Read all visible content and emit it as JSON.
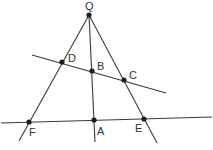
{
  "diagram": {
    "type": "geometry",
    "colors": {
      "line": "#3a3a3a",
      "point": "#1e1e1e",
      "label": "#333333"
    },
    "points": [
      {
        "name": "Q",
        "x": 89,
        "y": 15,
        "lx": 85,
        "ly": 10
      },
      {
        "name": "D",
        "x": 62,
        "y": 62,
        "lx": 68,
        "ly": 62
      },
      {
        "name": "B",
        "x": 92,
        "y": 71,
        "lx": 97,
        "ly": 70
      },
      {
        "name": "C",
        "x": 124,
        "y": 80,
        "lx": 129,
        "ly": 79
      },
      {
        "name": "F",
        "x": 29,
        "y": 122,
        "lx": 29,
        "ly": 136
      },
      {
        "name": "A",
        "x": 94,
        "y": 120,
        "lx": 97,
        "ly": 135
      },
      {
        "name": "E",
        "x": 144,
        "y": 119,
        "lx": 135,
        "ly": 132
      }
    ],
    "lines": [
      {
        "name": "line-QF",
        "x1": 89,
        "y1": 15,
        "x2": 19,
        "y2": 141
      },
      {
        "name": "line-QA",
        "x1": 89,
        "y1": 15,
        "x2": 95,
        "y2": 142
      },
      {
        "name": "line-QE",
        "x1": 89,
        "y1": 15,
        "x2": 157,
        "y2": 143
      },
      {
        "name": "line-DC",
        "x1": 32,
        "y1": 55,
        "x2": 166,
        "y2": 93
      },
      {
        "name": "line-FE",
        "x1": 1,
        "y1": 123,
        "x2": 212,
        "y2": 117
      }
    ],
    "labels": {
      "Q": "Q",
      "D": "D",
      "B": "B",
      "C": "C",
      "F": "F",
      "A": "A",
      "E": "E"
    }
  }
}
